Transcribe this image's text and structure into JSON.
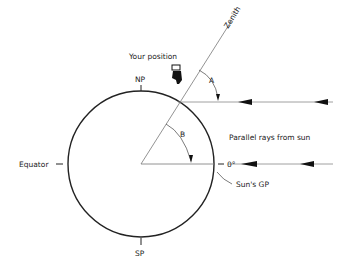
{
  "diagram": {
    "labels": {
      "zenith": "Zenith",
      "your_position": "Your position",
      "north_pole": "NP",
      "south_pole": "SP",
      "equator": "Equator",
      "angle_a": "A",
      "angle_b": "B",
      "zero_degrees": "0°",
      "parallel_rays": "Parallel rays from sun",
      "suns_gp": "Sun's GP"
    },
    "colors": {
      "line": "#222222",
      "ray": "#888888",
      "background": "#ffffff"
    }
  }
}
